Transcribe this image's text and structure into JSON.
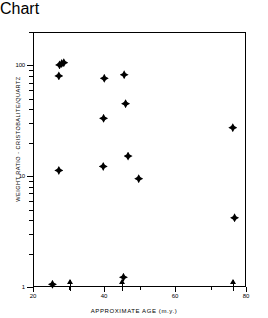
{
  "chart_data": {
    "type": "scatter",
    "title": "",
    "xlabel": "APPROXIMATE AGE (m.y.)",
    "ylabel": "WEIGHT RATIO - CRISTOBALITE/QUARTZ",
    "xlim": [
      20,
      80
    ],
    "ylim": [
      1,
      200
    ],
    "yscale": "log",
    "xscale": "linear",
    "grid": false,
    "legend": null,
    "xticks": [
      20,
      40,
      60,
      80
    ],
    "xticklabels": [
      "20",
      "40",
      "60",
      "80"
    ],
    "xminorticks": [
      30,
      50,
      70
    ],
    "yticks": [
      1,
      10,
      100
    ],
    "yticklabels": [
      "1",
      "10",
      "100"
    ],
    "marker": "filled-diamond",
    "marker_color": "#000000",
    "points": [
      {
        "x": 27.2,
        "y": 103
      },
      {
        "x": 27.8,
        "y": 106
      },
      {
        "x": 28.4,
        "y": 108
      },
      {
        "x": 27.0,
        "y": 82
      },
      {
        "x": 39.8,
        "y": 78
      },
      {
        "x": 45.4,
        "y": 84
      },
      {
        "x": 45.8,
        "y": 46
      },
      {
        "x": 39.6,
        "y": 34
      },
      {
        "x": 76.0,
        "y": 28
      },
      {
        "x": 46.5,
        "y": 15.5
      },
      {
        "x": 39.5,
        "y": 12.5
      },
      {
        "x": 27.0,
        "y": 11.5
      },
      {
        "x": 49.5,
        "y": 9.7
      },
      {
        "x": 76.5,
        "y": 4.3
      },
      {
        "x": 45.2,
        "y": 1.25
      },
      {
        "x": 25.2,
        "y": 1.08
      }
    ],
    "lower_limit_arrows": [
      {
        "x": 30.5,
        "y": 1
      },
      {
        "x": 45.2,
        "y": 1
      },
      {
        "x": 76.5,
        "y": 1
      }
    ],
    "arrow_note": "upward arrows at y=1 denote lower-limit (censored) values"
  }
}
